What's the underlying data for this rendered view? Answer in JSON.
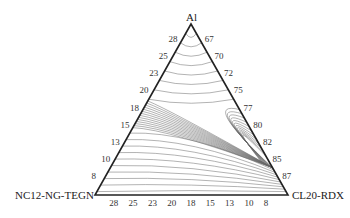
{
  "vertices": {
    "top": "Al",
    "left": "NC12-NG-TEGN",
    "right": "CL20-RDX"
  },
  "left_axis_ticks": [
    "28",
    "25",
    "23",
    "20",
    "18",
    "15",
    "13",
    "10",
    "8"
  ],
  "right_axis_ticks": [
    "67",
    "70",
    "72",
    "75",
    "77",
    "80",
    "82",
    "85",
    "87"
  ],
  "bottom_axis_ticks": [
    "28",
    "25",
    "23",
    "20",
    "18",
    "15",
    "13",
    "10",
    "8"
  ],
  "contour_labels": [
    "1.767",
    "1.778",
    "1.771",
    "1.793",
    "1.804",
    "1.914",
    "1.911",
    "1.807",
    "1.897",
    "1.818",
    "1.887",
    "1.838",
    "1.843",
    "1.827",
    "1.841",
    "1.863",
    "1.736",
    "1.726",
    "1.678",
    "1.636",
    "1.588",
    "1.548",
    "1.505",
    "1.455"
  ],
  "colors": {
    "line": "#222222",
    "contour": "#555555"
  }
}
